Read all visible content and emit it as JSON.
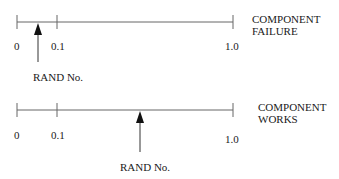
{
  "diagrams": [
    {
      "id": "failure",
      "caption_line1": "COMPONENT",
      "caption_line2": "FAILURE",
      "ticks": [
        {
          "value": 0,
          "label": "0"
        },
        {
          "value": 0.1,
          "label": "0.1"
        },
        {
          "value": 1.0,
          "label": "1.0"
        }
      ],
      "arrow_label": "RAND No.",
      "arrow_value_approx": 0.05
    },
    {
      "id": "works",
      "caption_line1": "COMPONENT",
      "caption_line2": "WORKS",
      "ticks": [
        {
          "value": 0,
          "label": "0"
        },
        {
          "value": 0.1,
          "label": "0.1"
        },
        {
          "value": 1.0,
          "label": "1.0"
        }
      ],
      "arrow_label": "RAND No.",
      "arrow_value_approx": 0.57
    }
  ],
  "colors": {
    "line": "#555555",
    "text": "#1a1a1a",
    "arrow": "#111111"
  }
}
